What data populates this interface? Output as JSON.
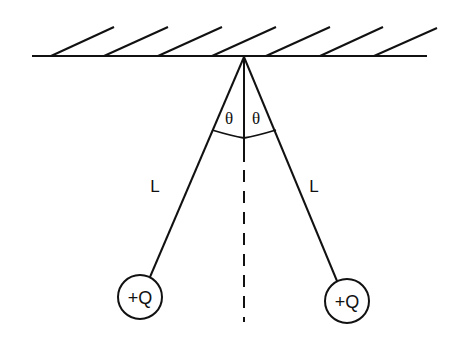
{
  "diagram": {
    "type": "charged-pendulums",
    "ceiling": {
      "x1": 32,
      "x2": 427,
      "y": 56
    },
    "hatches": [
      {
        "x1": 51,
        "y1": 56,
        "x2": 114,
        "y2": 27
      },
      {
        "x1": 104,
        "y1": 56,
        "x2": 168,
        "y2": 27
      },
      {
        "x1": 158,
        "y1": 56,
        "x2": 222,
        "y2": 27
      },
      {
        "x1": 212,
        "y1": 56,
        "x2": 276,
        "y2": 27
      },
      {
        "x1": 266,
        "y1": 56,
        "x2": 330,
        "y2": 27
      },
      {
        "x1": 320,
        "y1": 56,
        "x2": 383,
        "y2": 27
      },
      {
        "x1": 374,
        "y1": 56,
        "x2": 437,
        "y2": 28
      }
    ],
    "pivot": {
      "x": 244,
      "y": 57
    },
    "labels": {
      "theta_left": "θ",
      "theta_right": "θ",
      "length_left": "L",
      "length_right": "L",
      "charge_left": "+Q",
      "charge_right": "+Q"
    },
    "charges": [
      {
        "cx": 140,
        "cy": 297,
        "r": 22
      },
      {
        "cx": 347,
        "cy": 301,
        "r": 22
      }
    ],
    "colors": {
      "stroke": "#111111",
      "background": "#ffffff"
    }
  }
}
